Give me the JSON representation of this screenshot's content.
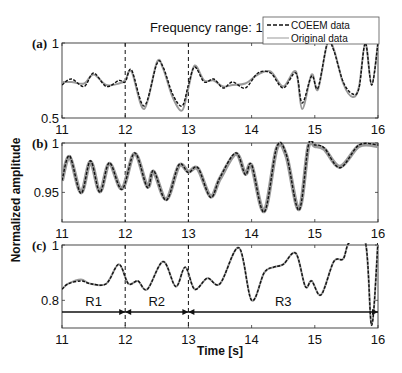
{
  "chart_data": {
    "type": "line",
    "title": "Frequency range: 1-4Hz",
    "xlabel": "Time [s]",
    "ylabel": "Normalized amplitude",
    "xlim": [
      11,
      16
    ],
    "x_ticks": [
      "11",
      "12",
      "13",
      "14",
      "15",
      "16"
    ],
    "legend": {
      "position": "upper right",
      "entries": [
        "COEEM data",
        "Original data"
      ]
    },
    "vertical_dashed_lines_at": [
      12,
      13
    ],
    "panels": [
      {
        "label": "(a)",
        "ylim": [
          0.5,
          1
        ],
        "y_ticks": [
          "0.5",
          "1"
        ],
        "series": [
          {
            "name": "COEEM data",
            "style": "dashed black",
            "x": [
              11.0,
              11.15,
              11.35,
              11.5,
              11.7,
              11.9,
              12.0,
              12.1,
              12.3,
              12.5,
              12.6,
              12.75,
              12.9,
              13.0,
              13.1,
              13.25,
              13.4,
              13.55,
              13.7,
              13.9,
              14.1,
              14.3,
              14.5,
              14.7,
              14.8,
              14.95,
              15.05,
              15.2,
              15.3,
              15.45,
              15.6,
              15.7,
              15.8,
              15.9,
              16.0
            ],
            "values": [
              0.72,
              0.76,
              0.71,
              0.8,
              0.71,
              0.75,
              0.74,
              0.82,
              0.58,
              0.86,
              0.84,
              0.66,
              0.58,
              0.72,
              0.84,
              0.74,
              0.76,
              0.7,
              0.74,
              0.7,
              0.8,
              0.8,
              0.7,
              0.8,
              0.6,
              0.78,
              0.7,
              1.0,
              0.95,
              0.74,
              0.66,
              0.7,
              1.0,
              0.72,
              1.0
            ]
          },
          {
            "name": "Original data",
            "style": "solid gray",
            "x": [
              11.0,
              11.15,
              11.35,
              11.5,
              11.7,
              11.9,
              12.0,
              12.1,
              12.3,
              12.5,
              12.6,
              12.75,
              12.9,
              13.0,
              13.1,
              13.25,
              13.4,
              13.55,
              13.7,
              13.9,
              14.1,
              14.3,
              14.5,
              14.7,
              14.8,
              14.95,
              15.05,
              15.2,
              15.3,
              15.45,
              15.6,
              15.7,
              15.8,
              15.9,
              16.0
            ],
            "values": [
              0.74,
              0.74,
              0.73,
              0.79,
              0.72,
              0.73,
              0.75,
              0.81,
              0.56,
              0.87,
              0.83,
              0.64,
              0.55,
              0.7,
              0.85,
              0.75,
              0.75,
              0.71,
              0.72,
              0.73,
              0.79,
              0.81,
              0.71,
              0.81,
              0.56,
              0.79,
              0.69,
              1.0,
              0.96,
              0.73,
              0.64,
              0.71,
              1.0,
              0.72,
              1.0
            ]
          }
        ]
      },
      {
        "label": "(b)",
        "ylim": [
          0.92,
          1
        ],
        "y_ticks": [
          "0.95",
          "1"
        ],
        "series": [
          {
            "name": "COEEM data",
            "style": "dashed black",
            "x": [
              11.0,
              11.12,
              11.3,
              11.45,
              11.6,
              11.75,
              11.95,
              12.15,
              12.35,
              12.45,
              12.65,
              12.85,
              13.0,
              13.15,
              13.35,
              13.5,
              13.75,
              13.9,
              14.0,
              14.2,
              14.4,
              14.55,
              14.75,
              14.9,
              15.0,
              15.15,
              15.4,
              15.7,
              16.0
            ],
            "values": [
              0.962,
              0.987,
              0.949,
              0.982,
              0.95,
              0.98,
              0.953,
              0.99,
              0.955,
              0.972,
              0.942,
              0.978,
              0.97,
              0.975,
              0.945,
              0.965,
              0.99,
              0.968,
              0.978,
              0.93,
              0.996,
              0.988,
              0.932,
              0.998,
              0.998,
              0.995,
              0.975,
              0.998,
              0.998
            ]
          },
          {
            "name": "Original data",
            "style": "solid gray",
            "x": [
              11.0,
              11.12,
              11.3,
              11.45,
              11.6,
              11.75,
              11.95,
              12.15,
              12.35,
              12.45,
              12.65,
              12.85,
              13.0,
              13.15,
              13.35,
              13.5,
              13.75,
              13.9,
              14.0,
              14.2,
              14.4,
              14.55,
              14.75,
              14.9,
              15.0,
              15.15,
              15.4,
              15.7,
              16.0
            ],
            "values": [
              0.962,
              0.986,
              0.95,
              0.981,
              0.951,
              0.979,
              0.954,
              0.989,
              0.956,
              0.971,
              0.943,
              0.977,
              0.971,
              0.974,
              0.946,
              0.964,
              0.989,
              0.969,
              0.977,
              0.931,
              0.995,
              0.987,
              0.933,
              0.997,
              0.997,
              0.994,
              0.976,
              0.997,
              0.997
            ]
          }
        ]
      },
      {
        "label": "(c)",
        "ylim": [
          0.7,
          1
        ],
        "y_ticks": [
          "0.8",
          "1"
        ],
        "annotations": [
          {
            "text": "R1",
            "x_from": 11,
            "x_to": 12
          },
          {
            "text": "R2",
            "x_from": 12,
            "x_to": 13
          },
          {
            "text": "R3",
            "x_from": 13,
            "x_to": 16
          }
        ],
        "series": [
          {
            "name": "COEEM data",
            "style": "dashed black",
            "x": [
              11.0,
              11.1,
              11.3,
              11.45,
              11.7,
              11.9,
              12.05,
              12.2,
              12.35,
              12.6,
              12.8,
              12.95,
              13.1,
              13.3,
              13.5,
              13.8,
              14.0,
              14.2,
              14.35,
              14.5,
              14.7,
              14.85,
              14.95,
              15.1,
              15.3,
              15.45,
              15.55,
              15.8,
              15.9,
              16.0
            ],
            "values": [
              0.84,
              0.86,
              0.87,
              0.86,
              0.86,
              0.93,
              0.86,
              0.87,
              0.84,
              0.94,
              0.85,
              0.92,
              0.84,
              0.88,
              0.86,
              0.99,
              0.8,
              0.9,
              0.92,
              0.93,
              0.97,
              0.85,
              0.87,
              0.82,
              0.94,
              0.95,
              1.01,
              1.01,
              0.71,
              1.01
            ]
          },
          {
            "name": "Original data",
            "style": "solid gray",
            "x": [
              11.0,
              11.1,
              11.3,
              11.45,
              11.7,
              11.9,
              12.05,
              12.2,
              12.35,
              12.6,
              12.8,
              12.95,
              13.1,
              13.3,
              13.5,
              13.8,
              14.0,
              14.2,
              14.35,
              14.5,
              14.7,
              14.85,
              14.95,
              15.1,
              15.3,
              15.45,
              15.55,
              15.8,
              15.9,
              16.0
            ],
            "values": [
              0.84,
              0.86,
              0.875,
              0.86,
              0.86,
              0.93,
              0.86,
              0.87,
              0.84,
              0.94,
              0.85,
              0.92,
              0.84,
              0.88,
              0.86,
              0.99,
              0.8,
              0.9,
              0.92,
              0.93,
              0.97,
              0.85,
              0.87,
              0.82,
              0.94,
              0.95,
              1.01,
              1.01,
              0.71,
              1.01
            ]
          }
        ]
      }
    ]
  }
}
